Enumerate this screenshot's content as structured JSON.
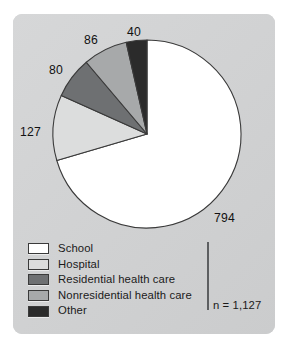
{
  "chart_data": {
    "type": "pie",
    "title": "",
    "categories": [
      "School",
      "Hospital",
      "Residential health care",
      "Nonresidential health care",
      "Other"
    ],
    "values": [
      794,
      127,
      80,
      86,
      40
    ],
    "value_labels": [
      "794",
      "127",
      "80",
      "86",
      "40"
    ],
    "total": 1127,
    "total_label": "n = 1,127",
    "legend_position": "bottom-left",
    "grid": false,
    "start_angle_deg": 0,
    "direction": "clockwise",
    "slice_colors": [
      "#ffffff",
      "#dcdddd",
      "#6e7072",
      "#a7a9aa",
      "#2b2b2b"
    ],
    "slice_percentages": [
      70.5,
      11.3,
      7.1,
      7.6,
      3.5
    ]
  },
  "figure": {
    "panel_color": "#d2d3d4",
    "page_background": "#ffffff",
    "outline_color": "#3a3a3a"
  },
  "legend": {
    "items": [
      {
        "label": "School",
        "color": "#ffffff",
        "swatch_name": "legend-swatch-school"
      },
      {
        "label": "Hospital",
        "color": "#dcdddd",
        "swatch_name": "legend-swatch-hospital"
      },
      {
        "label": "Residential health care",
        "color": "#6e7072",
        "swatch_name": "legend-swatch-residential"
      },
      {
        "label": "Nonresidential health care",
        "color": "#a7a9aa",
        "swatch_name": "legend-swatch-nonresidential"
      },
      {
        "label": "Other",
        "color": "#2b2b2b",
        "swatch_name": "legend-swatch-other"
      }
    ]
  },
  "annotations": {
    "school_value": "794",
    "hospital_value": "127",
    "residential_value": "80",
    "nonresidential_value": "86",
    "other_value": "40",
    "sample_size": "n = 1,127"
  }
}
